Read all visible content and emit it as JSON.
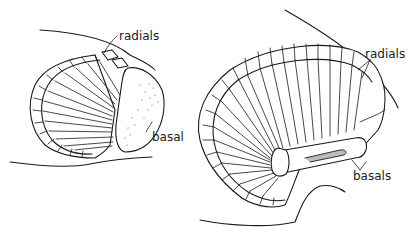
{
  "figure": {
    "left_fin": {
      "labels": {
        "radials": "radials",
        "basal": "basal"
      }
    },
    "right_fin": {
      "labels": {
        "radials": "radials",
        "basals": "basals"
      }
    }
  },
  "colors": {
    "ink": "#1a1a1a",
    "background": "#ffffff"
  }
}
